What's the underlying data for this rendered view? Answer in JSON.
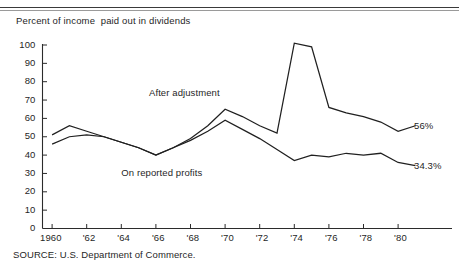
{
  "figure": {
    "title": "Percent of income  paid out in dividends",
    "source": "SOURCE: U.S. Department of Commerce."
  },
  "chart_data": {
    "type": "line",
    "title": "Percent of income  paid out in dividends",
    "xlabel": "",
    "ylabel": "Percent of income paid out in dividends",
    "xlim": [
      1960,
      1981
    ],
    "ylim": [
      0,
      100
    ],
    "yticks": [
      0,
      10,
      20,
      30,
      40,
      50,
      60,
      70,
      80,
      90,
      100
    ],
    "ytick_labels": [
      "0",
      "10",
      "20",
      "30",
      "40",
      "50",
      "60",
      "70",
      "80",
      "90",
      "100"
    ],
    "xticks": [
      1960,
      1962,
      1964,
      1966,
      1968,
      1970,
      1972,
      1974,
      1976,
      1978,
      1980
    ],
    "xtick_labels": [
      "1960",
      "'62",
      "'64",
      "'66",
      "'68",
      "'70",
      "'72",
      "'74",
      "'76",
      "'78",
      "'80"
    ],
    "grid": false,
    "legend": "inline-annotations",
    "annotations": [
      {
        "text": "After adjustment",
        "x": 1968.2,
        "y": 74
      },
      {
        "text": "On reported profits",
        "x": 1966.6,
        "y": 30
      }
    ],
    "end_labels": [
      {
        "series": "After adjustment",
        "text": "56%",
        "value": 56
      },
      {
        "series": "On reported profits",
        "text": "34.3%",
        "value": 34.3
      }
    ],
    "x": [
      1960,
      1961,
      1962,
      1963,
      1964,
      1965,
      1966,
      1967,
      1968,
      1969,
      1970,
      1971,
      1972,
      1973,
      1974,
      1975,
      1976,
      1977,
      1978,
      1979,
      1980,
      1981
    ],
    "series": [
      {
        "name": "After adjustment",
        "values": [
          51,
          56,
          53,
          50,
          47,
          44,
          40,
          44,
          49,
          56,
          65,
          61,
          56,
          52,
          101,
          99,
          66,
          63,
          61,
          58,
          53,
          56
        ]
      },
      {
        "name": "On reported profits",
        "values": [
          46,
          50,
          51,
          50,
          47,
          44,
          40,
          44,
          48,
          53,
          59,
          54,
          49,
          43,
          37,
          40,
          39,
          41,
          40,
          41,
          36,
          34.3
        ]
      }
    ]
  },
  "axis": {
    "y_title_unit": "percent"
  }
}
